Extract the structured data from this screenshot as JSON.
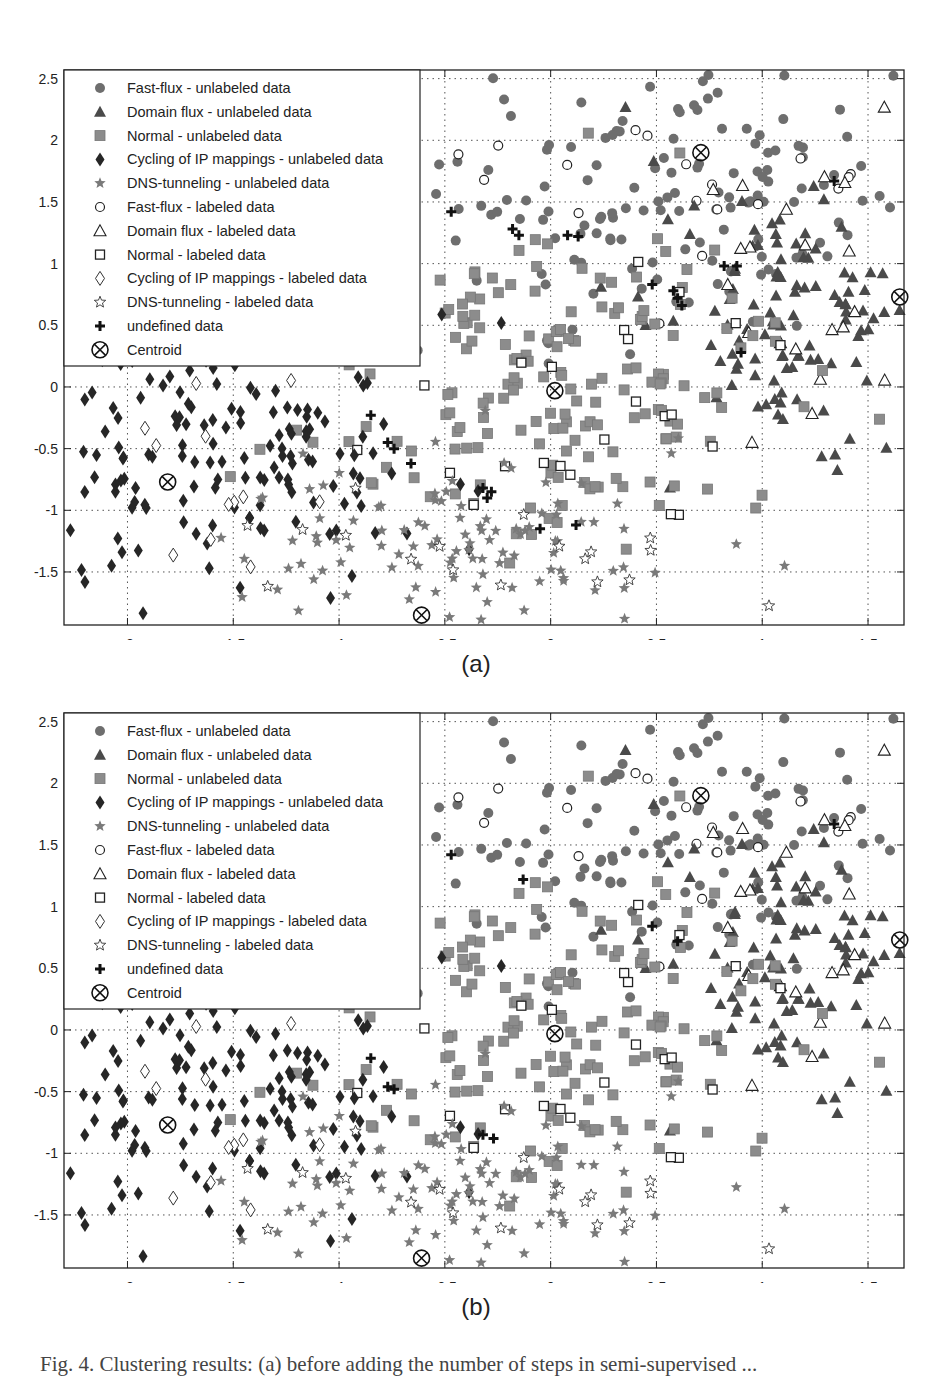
{
  "colors": {
    "filled": "#6e6e6e",
    "dark": "#262626",
    "square": "#8c8c8c",
    "star": "#7a7a7a",
    "grid": "#555555"
  },
  "legend": [
    {
      "marker": "circle-filled",
      "label": "Fast-flux - unlabeled data"
    },
    {
      "marker": "triangle-filled",
      "label": "Domain flux - unlabeled data"
    },
    {
      "marker": "square-filled",
      "label": "Normal - unlabeled data"
    },
    {
      "marker": "diamond-filled",
      "label": "Cycling of IP mappings - unlabeled data"
    },
    {
      "marker": "star-filled",
      "label": "DNS-tunneling - unlabeled data"
    },
    {
      "marker": "circle-open",
      "label": "Fast-flux - labeled data"
    },
    {
      "marker": "triangle-open",
      "label": "Domain flux - labeled data"
    },
    {
      "marker": "square-open",
      "label": "Normal - labeled data"
    },
    {
      "marker": "diamond-open",
      "label": "Cycling of IP mappings - labeled data"
    },
    {
      "marker": "star-open",
      "label": "DNS-tunneling - labeled data"
    },
    {
      "marker": "plus",
      "label": "undefined data"
    },
    {
      "marker": "centroid",
      "label": "Centroid"
    }
  ],
  "panels": [
    {
      "id": "a",
      "sublabel": "(a)"
    },
    {
      "id": "b",
      "sublabel": "(b)"
    }
  ],
  "caption": "Fig. 4. Clustering results: (a) before adding the number of steps in semi-supervised ...",
  "chart_data": [
    {
      "type": "scatter",
      "title": "(a)",
      "xlabel": "",
      "ylabel": "",
      "xlim": [
        -2.3,
        1.67
      ],
      "ylim": [
        -1.93,
        2.57
      ],
      "xticks": [
        -2,
        -1.5,
        -1,
        -0.5,
        0,
        0.5,
        1,
        1.5
      ],
      "yticks": [
        2.5,
        2,
        1.5,
        1,
        0.5,
        0,
        -0.5,
        -1,
        -1.5
      ],
      "grid": true,
      "legend_position": "upper left",
      "centroids": [
        {
          "cluster": "Fast-flux",
          "x": 0.71,
          "y": 1.9
        },
        {
          "cluster": "Domain flux",
          "x": 1.65,
          "y": 0.73
        },
        {
          "cluster": "Normal",
          "x": 0.02,
          "y": -0.03
        },
        {
          "cluster": "Cycling of IP mappings",
          "x": -1.81,
          "y": -0.77
        },
        {
          "cluster": "DNS-tunneling",
          "x": -0.61,
          "y": -1.85
        }
      ],
      "clusters": [
        {
          "name": "Fast-flux",
          "center": [
            0.55,
            1.55
          ],
          "spread": [
            0.62,
            0.55
          ],
          "n_unlabeled": 150,
          "n_labeled": 18,
          "seed": 11
        },
        {
          "name": "Domain flux",
          "center": [
            1.2,
            0.65
          ],
          "spread": [
            0.32,
            0.6
          ],
          "n_unlabeled": 120,
          "n_labeled": 22,
          "seed": 23
        },
        {
          "name": "Normal",
          "center": [
            0.05,
            0.0
          ],
          "spread": [
            0.6,
            0.6
          ],
          "n_unlabeled": 190,
          "n_labeled": 26,
          "seed": 37
        },
        {
          "name": "Cycling of IP mappings",
          "center": [
            -1.55,
            -0.55
          ],
          "spread": [
            0.45,
            0.6
          ],
          "n_unlabeled": 170,
          "n_labeled": 16,
          "seed": 41
        },
        {
          "name": "DNS-tunneling",
          "center": [
            -0.4,
            -1.3
          ],
          "spread": [
            0.55,
            0.35
          ],
          "n_unlabeled": 110,
          "n_labeled": 20,
          "seed": 53
        }
      ],
      "undefined_points": [
        [
          -1.78,
          0.88
        ],
        [
          -1.23,
          1.27
        ],
        [
          -1.27,
          1.2
        ],
        [
          -1.22,
          1.2
        ],
        [
          -0.93,
          1.25
        ],
        [
          -0.87,
          1.24
        ],
        [
          -0.47,
          1.42
        ],
        [
          -0.18,
          1.28
        ],
        [
          -0.15,
          1.23
        ],
        [
          0.13,
          1.22
        ],
        [
          0.08,
          1.23
        ],
        [
          0.48,
          0.83
        ],
        [
          0.58,
          0.78
        ],
        [
          0.6,
          0.72
        ],
        [
          0.62,
          0.66
        ],
        [
          0.82,
          0.98
        ],
        [
          0.88,
          0.98
        ],
        [
          0.9,
          0.28
        ],
        [
          1.34,
          1.67
        ],
        [
          -0.85,
          -0.23
        ],
        [
          -0.77,
          -0.45
        ],
        [
          -0.74,
          -0.5
        ],
        [
          -0.66,
          -0.62
        ],
        [
          -0.32,
          -0.82
        ],
        [
          -0.3,
          -0.9
        ],
        [
          -0.28,
          -0.85
        ],
        [
          -0.05,
          -1.15
        ],
        [
          0.12,
          -1.12
        ]
      ]
    },
    {
      "type": "scatter",
      "title": "(b)",
      "xlabel": "",
      "ylabel": "",
      "xlim": [
        -2.3,
        1.67
      ],
      "ylim": [
        -1.93,
        2.57
      ],
      "xticks": [
        -2,
        -1.5,
        -1,
        -0.5,
        0,
        0.5,
        1,
        1.5
      ],
      "yticks": [
        2.5,
        2,
        1.5,
        1,
        0.5,
        0,
        -0.5,
        -1,
        -1.5
      ],
      "grid": true,
      "legend_position": "upper left",
      "centroids": [
        {
          "cluster": "Fast-flux",
          "x": 0.71,
          "y": 1.9
        },
        {
          "cluster": "Domain flux",
          "x": 1.65,
          "y": 0.73
        },
        {
          "cluster": "Normal",
          "x": 0.02,
          "y": -0.03
        },
        {
          "cluster": "Cycling of IP mappings",
          "x": -1.81,
          "y": -0.77
        },
        {
          "cluster": "DNS-tunneling",
          "x": -0.61,
          "y": -1.85
        }
      ],
      "clusters": [
        {
          "name": "Fast-flux",
          "center": [
            0.55,
            1.55
          ],
          "spread": [
            0.62,
            0.55
          ],
          "n_unlabeled": 150,
          "n_labeled": 18,
          "seed": 11
        },
        {
          "name": "Domain flux",
          "center": [
            1.2,
            0.65
          ],
          "spread": [
            0.32,
            0.6
          ],
          "n_unlabeled": 120,
          "n_labeled": 22,
          "seed": 23
        },
        {
          "name": "Normal",
          "center": [
            0.05,
            0.0
          ],
          "spread": [
            0.6,
            0.6
          ],
          "n_unlabeled": 190,
          "n_labeled": 26,
          "seed": 37
        },
        {
          "name": "Cycling of IP mappings",
          "center": [
            -1.55,
            -0.55
          ],
          "spread": [
            0.45,
            0.6
          ],
          "n_unlabeled": 170,
          "n_labeled": 16,
          "seed": 41
        },
        {
          "name": "DNS-tunneling",
          "center": [
            -0.4,
            -1.3
          ],
          "spread": [
            0.55,
            0.35
          ],
          "n_unlabeled": 110,
          "n_labeled": 20,
          "seed": 53
        }
      ],
      "undefined_points": [
        [
          -0.47,
          1.42
        ],
        [
          -0.13,
          1.22
        ],
        [
          0.48,
          0.84
        ],
        [
          0.6,
          0.72
        ],
        [
          1.34,
          1.67
        ],
        [
          -0.85,
          -0.23
        ],
        [
          -0.77,
          -0.46
        ],
        [
          -0.74,
          -0.48
        ],
        [
          -0.32,
          -0.85
        ],
        [
          -0.27,
          -0.88
        ]
      ]
    }
  ]
}
